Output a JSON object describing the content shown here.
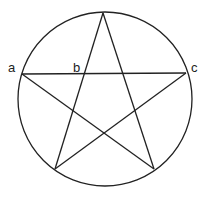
{
  "diagram": {
    "stroke_color": "#222222",
    "background": "#ffffff",
    "circle": {
      "cx": 105,
      "cy": 99,
      "r": 87
    },
    "vertices": {
      "top": [
        103,
        13
      ],
      "left": [
        22,
        74
      ],
      "right": [
        186,
        73
      ],
      "bottom_left": [
        55,
        169
      ],
      "bottom_right": [
        154,
        169
      ]
    },
    "labels": [
      {
        "id": "a",
        "text": "a",
        "x": 8,
        "y": 72
      },
      {
        "id": "b",
        "text": "b",
        "x": 73,
        "y": 72
      },
      {
        "id": "c",
        "text": "c",
        "x": 191,
        "y": 72
      }
    ]
  }
}
